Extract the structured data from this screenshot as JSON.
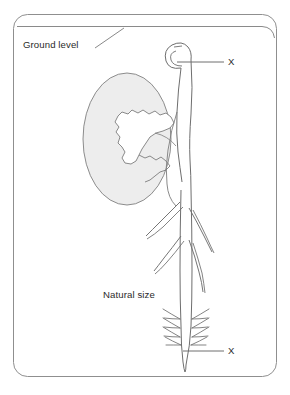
{
  "figure": {
    "title_alt": "Underground bulb with shoot and root, natural size",
    "background_color": "#ffffff",
    "border": {
      "name": "rounded-frame",
      "color": "#8a8a8a",
      "radius": 14
    },
    "ground_line": {
      "label": "Ground level",
      "color": "#8a8a8a"
    },
    "labels": {
      "ground_level": "Ground level",
      "natural_size": "Natural size",
      "x_top": "X",
      "x_bottom": "X"
    },
    "colors": {
      "outline": "#6e6e6e",
      "bulb_fill": "#ededed",
      "bulb_outline": "#777777",
      "text": "#2b2b2b",
      "leader_line": "#6e6e6e"
    },
    "parts": {
      "bulb": "bulb-tuber",
      "cut_away": "jagged-cut-section",
      "shoot": "curled-shoot-tip",
      "stem": "stem",
      "root": "taproot",
      "root_branches": "lateral-roots",
      "root_hairs": "root-hairs"
    }
  }
}
